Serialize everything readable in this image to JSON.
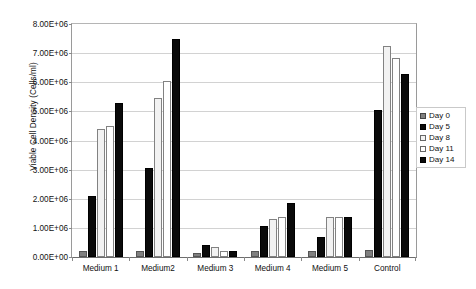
{
  "chart_data": {
    "type": "bar",
    "title": "",
    "subtitle": "",
    "xlabel": "",
    "ylabel": "Viable Cell Density (Cells/ml)",
    "categories": [
      "Medium 1",
      "Medium2",
      "Medium 3",
      "Medium 4",
      "Medium 5",
      "Control"
    ],
    "series": [
      {
        "name": "Day 0",
        "color": "#808080",
        "values": [
          200000,
          200000,
          150000,
          200000,
          200000,
          250000
        ]
      },
      {
        "name": "Day 5",
        "color": "#0a0a0a",
        "values": [
          2100000,
          3050000,
          400000,
          1050000,
          700000,
          5050000
        ]
      },
      {
        "name": "Day 8",
        "color": "#f2f2f2",
        "values": [
          4400000,
          5450000,
          350000,
          1300000,
          1370000,
          7250000
        ]
      },
      {
        "name": "Day 11",
        "color": "#ffffff",
        "values": [
          4500000,
          6050000,
          220000,
          1380000,
          1370000,
          6850000
        ]
      },
      {
        "name": "Day 14",
        "color": "#0a0a0a",
        "values": [
          5300000,
          7500000,
          220000,
          1870000,
          1370000,
          6300000
        ]
      }
    ],
    "ylim": [
      0,
      8000000
    ],
    "ytick_values": [
      0,
      1000000,
      2000000,
      3000000,
      4000000,
      5000000,
      6000000,
      7000000,
      8000000
    ],
    "ytick_labels": [
      "0.00E+00",
      "1.00E+06",
      "2.00E+06",
      "3.00E+06",
      "4.00E+06",
      "5.00E+06",
      "6.00E+06",
      "7.00E+06",
      "8.00E+06"
    ],
    "grid": true,
    "grid_axis": "y",
    "legend_position": "right",
    "legend_entries": [
      "Day 0",
      "Day 5",
      "Day 8",
      "Day 11",
      "Day 14"
    ],
    "background_color": "#ffffff",
    "axis_color": "#6d6d6d",
    "gridline_color": "#d2d2d2"
  }
}
